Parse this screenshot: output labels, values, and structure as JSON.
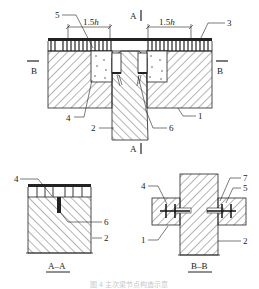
{
  "figure": {
    "caption": "图 4   主次梁节点构造示意",
    "caption_color": "#c8c8c8",
    "line_color": "#222222",
    "hatch_color": "#444444"
  },
  "main_view": {
    "dimensions": [
      {
        "id": "dim-left",
        "label": "1.5",
        "unit_symbol": "h"
      },
      {
        "id": "dim-right",
        "label": "1.5",
        "unit_symbol": "h"
      }
    ],
    "section_marks": {
      "a_top": "A",
      "a_bottom": "A",
      "b_left": "B",
      "b_right": "B"
    },
    "callouts": [
      {
        "number": "5"
      },
      {
        "number": "3"
      },
      {
        "number": "4"
      },
      {
        "number": "2"
      },
      {
        "number": "6"
      },
      {
        "number": "1"
      }
    ]
  },
  "section_a": {
    "title": "A–A",
    "callouts": [
      {
        "number": "4"
      },
      {
        "number": "6"
      },
      {
        "number": "2"
      }
    ]
  },
  "section_b": {
    "title": "B–B",
    "callouts": [
      {
        "number": "4"
      },
      {
        "number": "7"
      },
      {
        "number": "5"
      },
      {
        "number": "1"
      },
      {
        "number": "2"
      }
    ]
  }
}
